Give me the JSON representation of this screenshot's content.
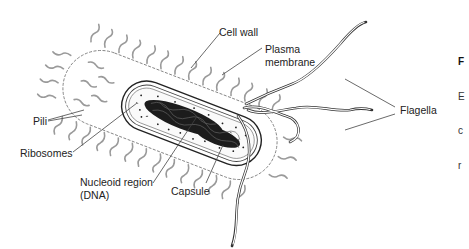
{
  "diagram": {
    "labels": {
      "cell_wall": "Cell wall",
      "plasma_membrane_line1": "Plasma",
      "plasma_membrane_line2": "membrane",
      "pili": "Pili",
      "ribosomes": "Ribosomes",
      "nucleoid_line1": "Nucleoid region",
      "nucleoid_line2": "(DNA)",
      "capsule": "Capsule",
      "flagella": "Flagella"
    },
    "caption_fragment": {
      "line1": "F",
      "line2": "E",
      "line3": "c",
      "line4": "r"
    },
    "colors": {
      "background": "#ffffff",
      "line": "#333333",
      "pili": "#9a9a9a",
      "dna": "#1c1c1c",
      "text": "#222222"
    }
  }
}
